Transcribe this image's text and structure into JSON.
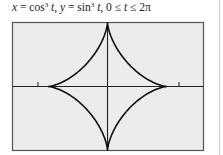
{
  "figure": {
    "caption_parts": {
      "x": "x",
      "eq1": " = cos",
      "exp1": "3",
      "t1": "t",
      "sep1": ", ",
      "y": "y",
      "eq2": " = sin",
      "exp2": "3",
      "t2": "t",
      "sep2": ", 0 ≤ ",
      "t3": "t",
      "range": " ≤ 2π"
    },
    "caption_full": "x = cos³ t, y = sin³ t, 0 ≤ t ≤ 2π"
  },
  "chart_data": {
    "type": "line",
    "curve": "astroid",
    "parametric": {
      "x": "cos^3 t",
      "y": "sin^3 t",
      "t_range": [
        0,
        6.2832
      ]
    },
    "xlabel": "",
    "ylabel": "",
    "xlim": [
      -1.5,
      1.5
    ],
    "ylim": [
      -1,
      1
    ],
    "x_ticks": [
      -1,
      1
    ],
    "cusps": [
      [
        1,
        0
      ],
      [
        0,
        1
      ],
      [
        -1,
        0
      ],
      [
        0,
        -1
      ]
    ],
    "grid": false,
    "legend": null,
    "colors": {
      "background": "#ececec",
      "frame": "#555555",
      "curve": "#111111",
      "axes": "#222222"
    }
  }
}
